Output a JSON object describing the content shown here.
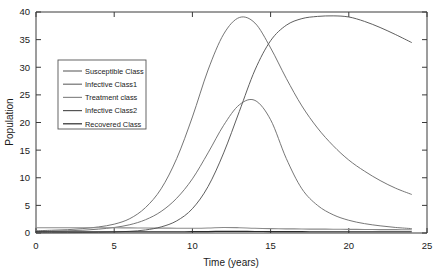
{
  "chart_data": {
    "type": "line",
    "title": "",
    "xlabel": "Time (years)",
    "ylabel": "Population",
    "xlim": [
      0,
      25
    ],
    "ylim": [
      0,
      40
    ],
    "xticks": [
      0,
      5,
      10,
      15,
      20,
      25
    ],
    "yticks": [
      0,
      5,
      10,
      15,
      20,
      25,
      30,
      35,
      40
    ],
    "grid": false,
    "legend_position": "upper-left",
    "x": [
      0,
      1,
      2,
      3,
      4,
      5,
      6,
      7,
      8,
      9,
      10,
      11,
      12,
      13,
      14,
      15,
      16,
      17,
      18,
      19,
      20,
      21,
      22,
      23,
      24
    ],
    "series": [
      {
        "name": "Susceptible Class",
        "color": "#6e6e6e",
        "values": [
          0.4,
          0.5,
          0.6,
          0.8,
          1.1,
          1.6,
          2.6,
          4.6,
          8.0,
          13.5,
          21.0,
          29.5,
          36.0,
          39.0,
          38.0,
          33.5,
          28.0,
          23.0,
          19.0,
          15.8,
          13.2,
          11.2,
          9.5,
          8.1,
          7.0
        ]
      },
      {
        "name": "Infective Class1",
        "color": "#707070",
        "values": [
          0.3,
          0.35,
          0.4,
          0.5,
          0.7,
          1.0,
          1.5,
          2.4,
          3.9,
          6.3,
          9.8,
          14.5,
          19.5,
          23.2,
          24.0,
          20.5,
          13.5,
          8.0,
          5.0,
          3.3,
          2.3,
          1.7,
          1.3,
          1.0,
          0.8
        ]
      },
      {
        "name": "Treatment class",
        "color": "#8a8a8a",
        "values": [
          0.95,
          0.95,
          0.95,
          0.95,
          0.95,
          0.95,
          0.92,
          0.9,
          0.88,
          0.86,
          0.86,
          0.9,
          1.0,
          0.95,
          0.85,
          0.8,
          0.75,
          0.72,
          0.7,
          0.68,
          0.66,
          0.64,
          0.62,
          0.6,
          0.58
        ]
      },
      {
        "name": "Infective Class2",
        "color": "#555555",
        "values": [
          0.05,
          0.06,
          0.07,
          0.09,
          0.12,
          0.18,
          0.3,
          0.55,
          1.1,
          2.2,
          4.4,
          8.4,
          14.5,
          22.0,
          29.5,
          34.8,
          37.6,
          38.8,
          39.2,
          39.3,
          39.1,
          38.3,
          37.2,
          35.9,
          34.5
        ]
      },
      {
        "name": "Recovered Class",
        "color": "#2b2b2b",
        "values": [
          0.22,
          0.22,
          0.22,
          0.22,
          0.22,
          0.22,
          0.22,
          0.22,
          0.22,
          0.23,
          0.24,
          0.26,
          0.3,
          0.3,
          0.28,
          0.26,
          0.25,
          0.24,
          0.23,
          0.23,
          0.22,
          0.22,
          0.22,
          0.22,
          0.22
        ]
      }
    ]
  }
}
